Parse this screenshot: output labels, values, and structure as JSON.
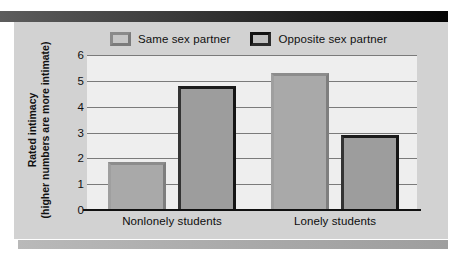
{
  "chart_data": {
    "type": "bar",
    "title": "",
    "subtitle": "",
    "xlabel": "",
    "ylabel": "Rated intimacy",
    "ylabel_line2": "(higher numbers are more intimate)",
    "categories": [
      "Nonlonely students",
      "Lonely students"
    ],
    "series": [
      {
        "name": "Same sex partner",
        "values": [
          1.85,
          5.3
        ],
        "color": "#a9a9a9"
      },
      {
        "name": "Opposite sex partner",
        "values": [
          4.8,
          2.9
        ],
        "color": "#9d9d9d"
      }
    ],
    "ylim": [
      0,
      6
    ],
    "yticks": [
      "0",
      "1",
      "2",
      "3",
      "4",
      "5",
      "6"
    ],
    "ytick_values": [
      0,
      1,
      2,
      3,
      4,
      5,
      6
    ],
    "grid": true,
    "legend_position": "top"
  },
  "legend": {
    "entries": [
      {
        "label": "Same sex partner",
        "swatch": "legend-swatch-same-sex"
      },
      {
        "label": "Opposite sex partner",
        "swatch": "legend-swatch-opposite-sex"
      }
    ]
  },
  "axis": {
    "y_title_line1": "Rated intimacy",
    "y_title_line2": "(higher numbers are more intimate)",
    "tick_0": "0",
    "tick_1": "1",
    "tick_2": "2",
    "tick_3": "3",
    "tick_4": "4",
    "tick_5": "5",
    "tick_6": "6"
  },
  "categories": {
    "cat_0": "Nonlonely students",
    "cat_1": "Lonely students"
  },
  "colors": {
    "panel_background": "#d2d2d2",
    "plot_background": "#eeeeee",
    "gridline": "#7a7a7a",
    "baseline": "#111111",
    "bar_same_fill": "#a9a9a9",
    "bar_opposite_fill": "#9d9d9d",
    "bar_opposite_border": "#1b1b1b",
    "top_rule": "#1d1d1d",
    "bottom_rule": "#aaaaaa"
  }
}
